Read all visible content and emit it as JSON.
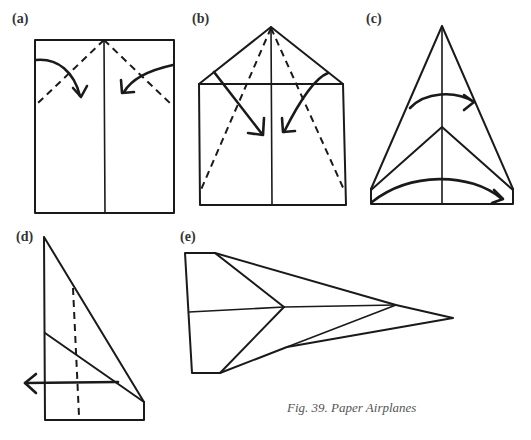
{
  "figure": {
    "caption": "Fig. 39. Paper Airplanes",
    "panels": [
      {
        "id": "a",
        "label": "(a)",
        "description": "Rectangle sheet with center crease; top corners folded down along dashed lines"
      },
      {
        "id": "b",
        "label": "(b)",
        "description": "Top corners folded to center forming point; fold edges again to center along dashed lines"
      },
      {
        "id": "c",
        "label": "(c)",
        "description": "Narrow triangle; fold in half along center line"
      },
      {
        "id": "d",
        "label": "(d)",
        "description": "Folded half; fold wing down along dashed line"
      },
      {
        "id": "e",
        "label": "(e)",
        "description": "Finished paper airplane, top view"
      }
    ]
  }
}
